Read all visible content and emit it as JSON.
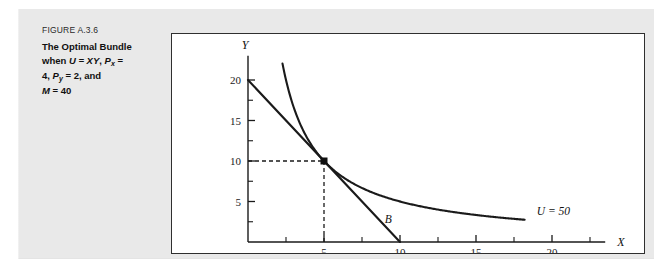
{
  "figure": {
    "number_label": "FIGURE A.3.6",
    "title_line1_pre": "The Optimal Bundle",
    "title_line2_pre": "when ",
    "title_u": "U = XY",
    "title_px": "P",
    "title_px_sub": "x",
    "title_px_post": " =",
    "title_line3": "4, ",
    "title_py": "P",
    "title_py_sub": "y",
    "title_py_post": " = 2, and",
    "title_line4_m": "M",
    "title_line4_post": " = 40"
  },
  "chart_data": {
    "type": "line",
    "title": "The Optimal Bundle when U = XY, Px = 4, Py = 2, and M = 40",
    "xlabel": "X",
    "ylabel": "Y",
    "xlim": [
      0,
      23.5
    ],
    "ylim": [
      0,
      23
    ],
    "grid": false,
    "x_ticks_major": [
      5,
      10,
      15,
      20
    ],
    "x_tick_labels": [
      "5",
      "10",
      "15",
      "20"
    ],
    "x_ticks_minor": [
      2.5,
      7.5,
      12.5,
      17.5,
      22.5
    ],
    "y_ticks_major": [
      5,
      10,
      15,
      20
    ],
    "y_tick_labels": [
      "5",
      "10",
      "15",
      "20"
    ],
    "y_ticks_minor": [
      2.5,
      7.5,
      12.5,
      17.5
    ],
    "series": [
      {
        "name": "B",
        "type": "budget-line",
        "label": "B",
        "label_x": 9.0,
        "label_y": 2.3,
        "points": [
          [
            0,
            20
          ],
          [
            10,
            0
          ]
        ],
        "color": "#1a1a1a"
      },
      {
        "name": "U = 50",
        "type": "indifference-curve",
        "label": "U = 50",
        "label_x": 19.0,
        "label_y": 3.3,
        "equation": "X*Y = 50",
        "x_start": 2.27,
        "x_end": 18.2,
        "color": "#1a1a1a"
      }
    ],
    "annotations": [
      {
        "name": "optimal-bundle-point",
        "x": 5,
        "y": 10,
        "marker": "square",
        "guide_lines": "dashed to both axes"
      }
    ]
  }
}
